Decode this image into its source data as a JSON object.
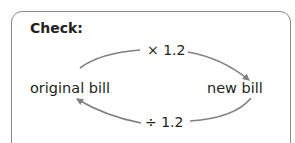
{
  "panel": {
    "title": "Check:"
  },
  "diagram": {
    "nodes": {
      "left": "original bill",
      "right": "new bill"
    },
    "edges": {
      "top": {
        "label": "× 1.2",
        "from": "original bill",
        "to": "new bill"
      },
      "bottom": {
        "label": "÷ 1.2",
        "from": "new bill",
        "to": "original bill"
      }
    },
    "colors": {
      "arrow": "#808080",
      "border": "#8a8a8a",
      "text": "#231f20"
    }
  }
}
